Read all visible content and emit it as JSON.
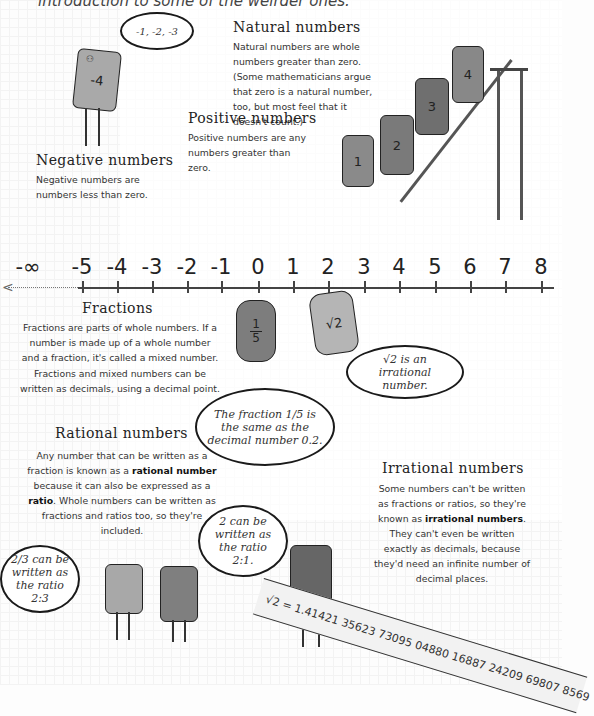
{
  "intro": "introduction to some of the weirder ones.",
  "sections": {
    "natural": {
      "title": "Natural numbers",
      "text": "Natural numbers are whole numbers greater than zero. (Some mathematicians argue that zero is a natural number, too, but most feel that it doesn't count.)"
    },
    "positive": {
      "title": "Positive numbers",
      "text": "Positive numbers are any numbers greater than zero."
    },
    "negative": {
      "title": "Negative numbers",
      "text": "Negative numbers are numbers less than zero."
    },
    "fractions": {
      "title": "Fractions",
      "text1": "Fractions are parts of whole numbers. If a number is made up of a whole number and a fraction, it's called a mixed number.",
      "text2": "Fractions and mixed numbers can be written as decimals, using a decimal point."
    },
    "rational": {
      "title": "Rational numbers",
      "text_a": "Any number that can be written as a fraction is known as a ",
      "bold1": "rational number",
      "text_b": " because it can also be expressed as a ",
      "bold2": "ratio",
      "text_c": ". Whole numbers can be written as fractions and ratios too, so they're included."
    },
    "irrational": {
      "title": "Irrational numbers",
      "text_a": "Some numbers can't be written as fractions or ratios, so they're known as ",
      "bold1": "irrational numbers",
      "text_b": ". They can't even be written exactly as decimals, because they'd need an infinite number of decimal places."
    }
  },
  "bubbles": {
    "negatives": "-1, -2, -3",
    "fifth": "The fraction 1/5 is the same as the decimal number 0.2.",
    "sqrt2": "√2 is an irrational number.",
    "two_thirds": "2/3 can be written as the ratio 2:3",
    "two": "2 can be written as the ratio 2:1."
  },
  "characters": {
    "neg4": "-4",
    "one": "1",
    "two": "2",
    "three": "3",
    "four": "4",
    "fifth_num": "1",
    "fifth_den": "5",
    "sqrt2": "√2"
  },
  "number_line": {
    "labels": [
      "-∞",
      "-5",
      "-4",
      "-3",
      "-2",
      "-1",
      "0",
      "1",
      "2",
      "3",
      "4",
      "5",
      "6",
      "7",
      "8"
    ]
  },
  "ribbon": "√2 = 1.41421 35623 73095 04880 16887 24209 69807 8569"
}
